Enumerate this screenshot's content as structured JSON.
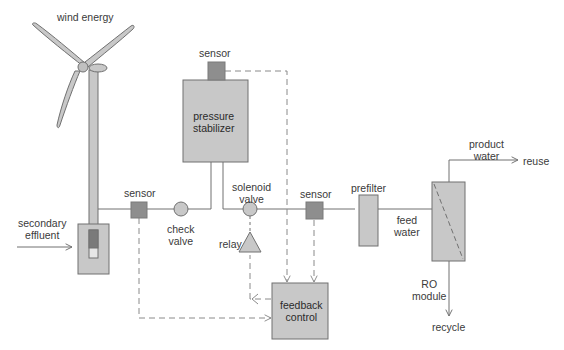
{
  "diagram": {
    "colors": {
      "fill": "#c8c8c8",
      "sensor_fill": "#8e8e8e",
      "stroke": "#707070",
      "dashed": "#8a8a8a",
      "text": "#3a3a3a"
    },
    "labels": {
      "wind_energy": "wind energy",
      "secondary_effluent": "secondary\neffluent",
      "sensor_left": "sensor",
      "check_valve": "check\nvalve",
      "sensor_top": "sensor",
      "pressure_stabilizer": "pressure\nstabilizer",
      "solenoid_valve": "solenoid\nvalve",
      "relay": "relay",
      "sensor_mid": "sensor",
      "feedback_control": "feedback\ncontrol",
      "prefilter": "prefilter",
      "feed_water": "feed\nwater",
      "product_water": "product\nwater",
      "reuse": "reuse",
      "ro_module": "RO\nmodule",
      "recycle": "recycle"
    },
    "nodes": [
      {
        "id": "wind-turbine",
        "label": "wind energy"
      },
      {
        "id": "well",
        "label": "secondary effluent"
      },
      {
        "id": "sensor-1",
        "label": "sensor"
      },
      {
        "id": "check-valve",
        "label": "check valve"
      },
      {
        "id": "pressure-stabilizer",
        "label": "pressure stabilizer"
      },
      {
        "id": "sensor-2",
        "label": "sensor"
      },
      {
        "id": "solenoid-valve",
        "label": "solenoid valve"
      },
      {
        "id": "relay",
        "label": "relay"
      },
      {
        "id": "sensor-3",
        "label": "sensor"
      },
      {
        "id": "feedback-control",
        "label": "feedback control"
      },
      {
        "id": "prefilter",
        "label": "prefilter"
      },
      {
        "id": "ro-module",
        "label": "RO module"
      }
    ],
    "edges": [
      {
        "from": "secondary effluent",
        "to": "well",
        "type": "flow"
      },
      {
        "from": "well",
        "to": "check valve",
        "type": "pipe"
      },
      {
        "from": "check valve",
        "to": "pressure stabilizer",
        "type": "pipe"
      },
      {
        "from": "pressure stabilizer",
        "to": "solenoid valve",
        "type": "pipe"
      },
      {
        "from": "solenoid valve",
        "to": "prefilter",
        "type": "pipe"
      },
      {
        "from": "prefilter",
        "to": "RO module",
        "type": "pipe",
        "label": "feed water"
      },
      {
        "from": "RO module",
        "to": "reuse",
        "type": "flow",
        "label": "product water"
      },
      {
        "from": "RO module",
        "to": "recycle",
        "type": "flow"
      },
      {
        "from": "sensor (left)",
        "to": "feedback control",
        "type": "signal"
      },
      {
        "from": "sensor (top)",
        "to": "feedback control",
        "type": "signal"
      },
      {
        "from": "sensor (mid)",
        "to": "feedback control",
        "type": "signal"
      },
      {
        "from": "feedback control",
        "to": "relay",
        "type": "signal"
      },
      {
        "from": "relay",
        "to": "solenoid valve",
        "type": "control"
      }
    ]
  }
}
